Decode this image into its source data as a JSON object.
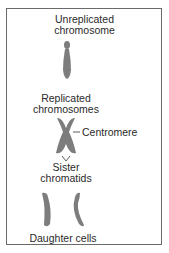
{
  "diagram": {
    "labels": {
      "unreplicated_line1": "Unreplicated",
      "unreplicated_line2": "chromosome",
      "replicated_line1": "Replicated",
      "replicated_line2": "chromosomes",
      "centromere": "Centromere",
      "sister_line1": "Sister",
      "sister_line2": "chromatids",
      "daughter_cells": "Daughter cells"
    },
    "colors": {
      "chromosome": "#7d7d7d",
      "border": "#6a6a6a",
      "text": "#2a2a2a"
    }
  }
}
